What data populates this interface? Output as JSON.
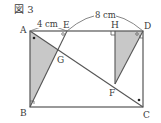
{
  "figure": {
    "title": "図 3",
    "colors": {
      "line": "#555555",
      "shade": "#c8c8c8",
      "text": "#3a3a3a",
      "background": "#ffffff"
    },
    "points": {
      "A": {
        "label": "A",
        "x": 30,
        "y": 31
      },
      "B": {
        "label": "B",
        "x": 30,
        "y": 107
      },
      "C": {
        "label": "C",
        "x": 143,
        "y": 107
      },
      "D": {
        "label": "D",
        "x": 143,
        "y": 31
      },
      "E": {
        "label": "E",
        "x": 67,
        "y": 31
      },
      "H": {
        "label": "H",
        "x": 115,
        "y": 31
      },
      "G": {
        "label": "G",
        "x": 58,
        "y": 50
      },
      "F": {
        "label": "F",
        "x": 115,
        "y": 84
      }
    },
    "measurements": {
      "AE": "4 cm",
      "ED": "8 cm"
    },
    "shaded_regions": [
      "triangle ABG",
      "triangle HDF"
    ],
    "segments": [
      "AB",
      "BC",
      "CD",
      "DA",
      "AC",
      "BE",
      "DF",
      "HF"
    ],
    "markers": {
      "right_angle_at_H": true,
      "angle_marks_circle": [
        "E",
        "D"
      ],
      "angle_marks_dot": [
        "A",
        "C"
      ],
      "angle_marks_square_small": [
        "B",
        "D-right"
      ]
    }
  }
}
